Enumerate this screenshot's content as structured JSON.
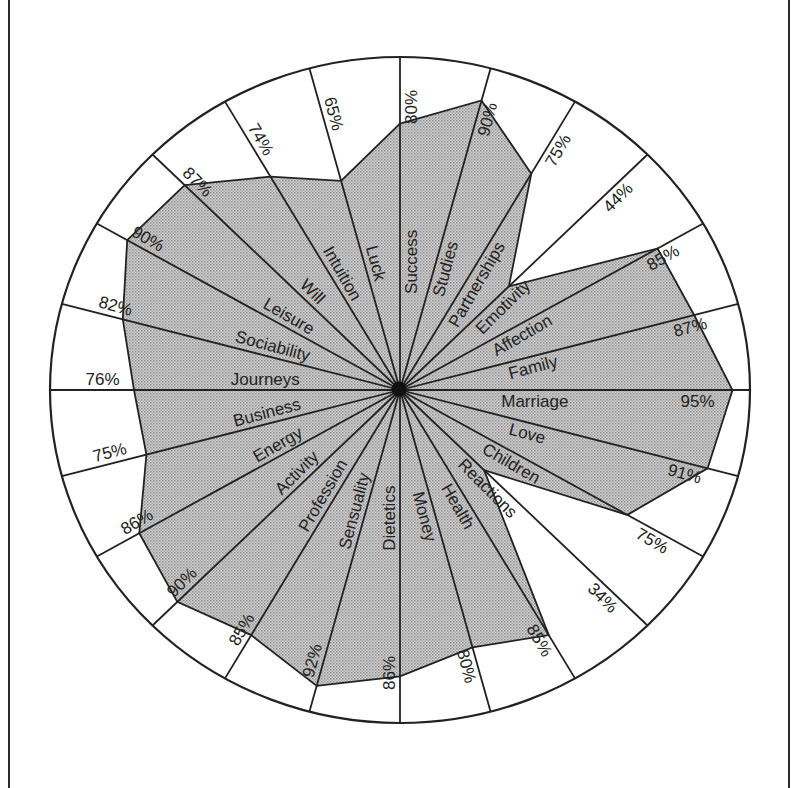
{
  "chart_data": {
    "type": "radar",
    "title": "",
    "value_unit": "%",
    "range": [
      0,
      100
    ],
    "grid": "24 radial spokes, outer ellipse, no concentric rings",
    "categories": [
      "Success",
      "Studies",
      "Partnerships",
      "Emotivity",
      "Affection",
      "Family",
      "Marriage",
      "Love",
      "Children",
      "Reactions",
      "Health",
      "Money",
      "Dietetics",
      "Sensuality",
      "Profession",
      "Activity",
      "Energy",
      "Business",
      "Journeys",
      "Sociability",
      "Leisure",
      "Will",
      "Intuition",
      "Luck"
    ],
    "values": [
      80,
      90,
      75,
      44,
      85,
      87,
      95,
      91,
      75,
      34,
      85,
      80,
      86,
      92,
      85,
      90,
      86,
      75,
      76,
      82,
      90,
      87,
      74,
      65
    ],
    "value_labels": [
      "80%",
      "90%",
      "75%",
      "44%",
      "85%",
      "87%",
      "95%",
      "91%",
      "75%",
      "34%",
      "85%",
      "80%",
      "86%",
      "92%",
      "85%",
      "90%",
      "86%",
      "75%",
      "76%",
      "82%",
      "90%",
      "87%",
      "74%",
      "65%"
    ],
    "start_angle_deg": 0,
    "direction": "clockwise",
    "fill_style": "gray dotted screen",
    "legend": null
  },
  "colors": {
    "line": "#222222",
    "fill_dark": "#9a9a9a",
    "fill_light": "#d6d6d6",
    "background": "#ffffff"
  }
}
